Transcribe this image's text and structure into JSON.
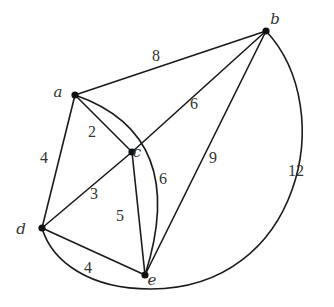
{
  "diagram": {
    "type": "weighted-undirected-graph",
    "nodes": [
      {
        "id": "a",
        "label": "a",
        "x": 75,
        "y": 95,
        "label_x": 58,
        "label_y": 97
      },
      {
        "id": "b",
        "label": "b",
        "x": 266,
        "y": 31,
        "label_x": 275,
        "label_y": 24
      },
      {
        "id": "c",
        "label": "c",
        "x": 132,
        "y": 152,
        "label_x": 137,
        "label_y": 157
      },
      {
        "id": "d",
        "label": "d",
        "x": 42,
        "y": 228,
        "label_x": 21,
        "label_y": 234
      },
      {
        "id": "e",
        "label": "e",
        "x": 145,
        "y": 275,
        "label_x": 152,
        "label_y": 285
      }
    ],
    "edges": [
      {
        "id": "a-b",
        "from": "a",
        "to": "b",
        "weight": "8",
        "path": "M75,95 L266,31",
        "label_x": 156,
        "label_y": 61
      },
      {
        "id": "a-c",
        "from": "a",
        "to": "c",
        "weight": "2",
        "path": "M75,95 L132,152",
        "label_x": 92,
        "label_y": 137
      },
      {
        "id": "a-d",
        "from": "a",
        "to": "d",
        "weight": "4",
        "path": "M75,95 L42,228",
        "label_x": 44,
        "label_y": 163
      },
      {
        "id": "a-e",
        "from": "a",
        "to": "e",
        "weight": "6",
        "path": "M75,95 Q190,135 145,275",
        "label_x": 163,
        "label_y": 184
      },
      {
        "id": "c-b",
        "from": "c",
        "to": "b",
        "weight": "6",
        "path": "M132,152 L266,31",
        "label_x": 194,
        "label_y": 109
      },
      {
        "id": "c-d",
        "from": "c",
        "to": "d",
        "weight": "3",
        "path": "M132,152 L42,228",
        "label_x": 94,
        "label_y": 199
      },
      {
        "id": "c-e",
        "from": "c",
        "to": "e",
        "weight": "5",
        "path": "M132,152 L145,275",
        "label_x": 120,
        "label_y": 221
      },
      {
        "id": "b-e",
        "from": "b",
        "to": "e",
        "weight": "9",
        "path": "M266,31 L145,275",
        "label_x": 213,
        "label_y": 163
      },
      {
        "id": "d-e",
        "from": "d",
        "to": "e",
        "weight": "4",
        "path": "M42,228 L145,275",
        "label_x": 88,
        "label_y": 273
      },
      {
        "id": "b-d",
        "from": "b",
        "to": "d",
        "weight": "12",
        "path": "M266,31 C340,110 300,290 150,289 C90,289 52,262 42,228",
        "label_x": 296,
        "label_y": 176
      }
    ]
  }
}
